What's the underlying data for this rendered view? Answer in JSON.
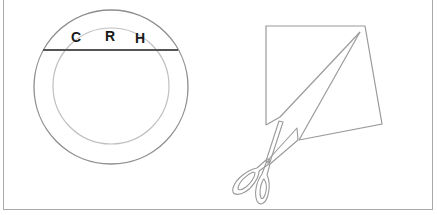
{
  "figure": {
    "left_panel": {
      "description": "Two concentric circles with a horizontal chord and three letters",
      "labels": [
        "C",
        "R",
        "H"
      ],
      "outer_circle": {
        "cx": 111,
        "cy": 87,
        "r": 77,
        "color": "#8e8e8e"
      },
      "inner_circle": {
        "cx": 111,
        "cy": 86,
        "r": 58,
        "color": "#bdbdbd"
      },
      "chord": {
        "y": 50,
        "x1": 43,
        "x2": 178,
        "color": "#555555"
      }
    },
    "right_panel": {
      "description": "Quadrilateral paper shape with a triangular cut and a pair of scissors",
      "shape_color": "#9a9a9a",
      "scissors_color": "#9a9a9a"
    }
  }
}
